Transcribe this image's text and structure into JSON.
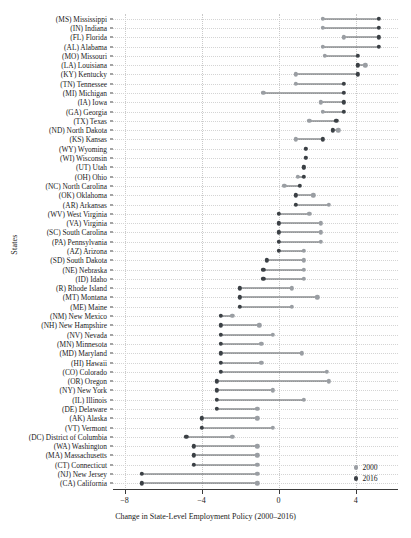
{
  "chart_data": {
    "type": "scatter",
    "subtype": "dumbbell",
    "title": "",
    "xlabel": "Change in State-Level Employment Policy (2000–2016)",
    "ylabel": "States",
    "xlim": [
      -8.6,
      6.2
    ],
    "xticks": [
      -8,
      -4,
      0,
      4
    ],
    "xticklabels": [
      "−8",
      "−4",
      "0",
      "4"
    ],
    "grid": "dotted both axes",
    "legend_position": "bottom-right",
    "legend": [
      {
        "name": "2000",
        "color": "#9a9ea3"
      },
      {
        "name": "2016",
        "color": "#3b4045"
      }
    ],
    "series": [
      "2000",
      "2016"
    ],
    "categories": [
      "(MS) Mississippi",
      "(IN) Indiana",
      "(FL) Florida",
      "(AL) Alabama",
      "(MO) Missouri",
      "(LA) Louisiana",
      "(KY) Kentucky",
      "(TN) Tennessee",
      "(MI) Michigan",
      "(IA) Iowa",
      "(GA) Georgia",
      "(TX) Texas",
      "(ND) North Dakota",
      "(KS) Kansas",
      "(WY) Wyoming",
      "(WI) Wisconsin",
      "(UT) Utah",
      "(OH) Ohio",
      "(NC) North Carolina",
      "(OK) Oklahoma",
      "(AR) Arkansas",
      "(WV) West Virginia",
      "(VA) Virginia",
      "(SC) South Carolina",
      "(PA) Pennsylvania",
      "(AZ) Arizona",
      "(SD) South Dakota",
      "(NE) Nebraska",
      "(ID) Idaho",
      "(R) Rhode Island",
      "(MT) Montana",
      "(ME) Maine",
      "(NM) New Mexico",
      "(NH) New Hampshire",
      "(NV) Nevada",
      "(MN) Minnesota",
      "(MD) Maryland",
      "(HI) Hawaii",
      "(CO) Colorado",
      "(OR) Oregon",
      "(NY) New York",
      "(IL) Illinois",
      "(DE) Delaware",
      "(AK) Alaska",
      "(VT) Vermont",
      "(DC) District of Columbia",
      "(WA) Washington",
      "(MA) Massachusetts",
      "(CT) Connecticut",
      "(NJ) New Jersey",
      "(CA) California"
    ],
    "points": [
      {
        "label": "(MS) Mississippi",
        "v2000": 2.3,
        "v2016": 5.2
      },
      {
        "label": "(IN) Indiana",
        "v2000": 2.3,
        "v2016": 5.2
      },
      {
        "label": "(FL) Florida",
        "v2000": 3.4,
        "v2016": 5.2
      },
      {
        "label": "(AL) Alabama",
        "v2000": 2.3,
        "v2016": 5.2
      },
      {
        "label": "(MO) Missouri",
        "v2000": 2.4,
        "v2016": 4.1
      },
      {
        "label": "(LA) Louisiana",
        "v2000": 4.5,
        "v2016": 4.1
      },
      {
        "label": "(KY) Kentucky",
        "v2000": 0.9,
        "v2016": 4.1
      },
      {
        "label": "(TN) Tennessee",
        "v2000": 0.9,
        "v2016": 3.4
      },
      {
        "label": "(MI) Michigan",
        "v2000": -0.8,
        "v2016": 3.4
      },
      {
        "label": "(IA) Iowa",
        "v2000": 2.2,
        "v2016": 3.4
      },
      {
        "label": "(GA) Georgia",
        "v2000": 2.3,
        "v2016": 3.4
      },
      {
        "label": "(TX) Texas",
        "v2000": 1.6,
        "v2016": 3.0
      },
      {
        "label": "(ND) North Dakota",
        "v2000": 3.1,
        "v2016": 2.8
      },
      {
        "label": "(KS) Kansas",
        "v2000": 0.9,
        "v2016": 2.3
      },
      {
        "label": "(WY) Wyoming",
        "v2000": 1.4,
        "v2016": 1.4
      },
      {
        "label": "(WI) Wisconsin",
        "v2000": 1.4,
        "v2016": 1.4
      },
      {
        "label": "(UT) Utah",
        "v2000": 1.3,
        "v2016": 1.3
      },
      {
        "label": "(OH) Ohio",
        "v2000": 1.0,
        "v2016": 1.3
      },
      {
        "label": "(NC) North Carolina",
        "v2000": 0.3,
        "v2016": 1.1
      },
      {
        "label": "(OK) Oklahoma",
        "v2000": 1.8,
        "v2016": 0.9
      },
      {
        "label": "(AR) Arkansas",
        "v2000": 2.6,
        "v2016": 0.9
      },
      {
        "label": "(WV) West Virginia",
        "v2000": 1.6,
        "v2016": 0.0
      },
      {
        "label": "(VA) Virginia",
        "v2000": 2.2,
        "v2016": 0.0
      },
      {
        "label": "(SC) South Carolina",
        "v2000": 2.2,
        "v2016": 0.0
      },
      {
        "label": "(PA) Pennsylvania",
        "v2000": 2.2,
        "v2016": 0.0
      },
      {
        "label": "(AZ) Arizona",
        "v2000": 1.3,
        "v2016": 0.0
      },
      {
        "label": "(SD) South Dakota",
        "v2000": 1.3,
        "v2016": -0.6
      },
      {
        "label": "(NE) Nebraska",
        "v2000": 1.3,
        "v2016": -0.8
      },
      {
        "label": "(ID) Idaho",
        "v2000": 1.3,
        "v2016": -0.8
      },
      {
        "label": "(R) Rhode Island",
        "v2000": 0.7,
        "v2016": -2.0
      },
      {
        "label": "(MT) Montana",
        "v2000": 2.0,
        "v2016": -2.0
      },
      {
        "label": "(ME) Maine",
        "v2000": 0.7,
        "v2016": -2.0
      },
      {
        "label": "(NM) New Mexico",
        "v2000": -2.4,
        "v2016": -3.0
      },
      {
        "label": "(NH) New Hampshire",
        "v2000": -1.0,
        "v2016": -3.0
      },
      {
        "label": "(NV) Nevada",
        "v2000": -0.3,
        "v2016": -3.0
      },
      {
        "label": "(MN) Minnesota",
        "v2000": -0.9,
        "v2016": -3.0
      },
      {
        "label": "(MD) Maryland",
        "v2000": 1.2,
        "v2016": -3.0
      },
      {
        "label": "(HI) Hawaii",
        "v2000": -0.9,
        "v2016": -3.0
      },
      {
        "label": "(CO) Colorado",
        "v2000": 2.5,
        "v2016": -3.0
      },
      {
        "label": "(OR) Oregon",
        "v2000": 2.6,
        "v2016": -3.2
      },
      {
        "label": "(NY) New York",
        "v2000": -0.3,
        "v2016": -3.2
      },
      {
        "label": "(IL) Illinois",
        "v2000": 1.3,
        "v2016": -3.2
      },
      {
        "label": "(DE) Delaware",
        "v2000": -1.1,
        "v2016": -3.2
      },
      {
        "label": "(AK) Alaska",
        "v2000": -1.1,
        "v2016": -4.0
      },
      {
        "label": "(VT) Vermont",
        "v2000": -0.3,
        "v2016": -4.0
      },
      {
        "label": "(DC) District of Columbia",
        "v2000": -2.4,
        "v2016": -4.8
      },
      {
        "label": "(WA) Washington",
        "v2000": -1.1,
        "v2016": -4.4
      },
      {
        "label": "(MA) Massachusetts",
        "v2000": -1.1,
        "v2016": -4.4
      },
      {
        "label": "(CT) Connecticut",
        "v2000": -1.1,
        "v2016": -4.4
      },
      {
        "label": "(NJ) New Jersey",
        "v2000": -1.1,
        "v2016": -7.1
      },
      {
        "label": "(CA) California",
        "v2000": -1.1,
        "v2016": -7.1
      }
    ]
  }
}
